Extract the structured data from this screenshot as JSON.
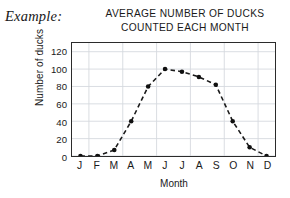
{
  "example": {
    "label": "Example:"
  },
  "chart_data": {
    "type": "line",
    "title": "AVERAGE NUMBER OF DUCKS COUNTED EACH MONTH",
    "title_lines": [
      "AVERAGE NUMBER OF DUCKS",
      "COUNTED EACH MONTH"
    ],
    "xlabel": "Month",
    "ylabel": "Number of ducks",
    "categories": [
      "J",
      "F",
      "M",
      "A",
      "M",
      "J",
      "J",
      "A",
      "S",
      "O",
      "N",
      "D"
    ],
    "values": [
      0,
      0,
      7,
      40,
      80,
      100,
      97,
      91,
      82,
      40,
      10,
      0
    ],
    "ylim": [
      0,
      130
    ],
    "yticks": [
      0,
      20,
      40,
      60,
      80,
      100,
      120
    ],
    "ytick_labels": [
      "0",
      "20",
      "40",
      "60",
      "80",
      "100",
      "120"
    ],
    "grid": true,
    "legend": "none",
    "line_style": "dashed",
    "marker": "filled-circle",
    "colors": {
      "line": "#1a1a1a",
      "marker": "#101010",
      "grid": "#d5d9de",
      "frame": "#2b2b2b",
      "background": "#ffffff"
    }
  }
}
